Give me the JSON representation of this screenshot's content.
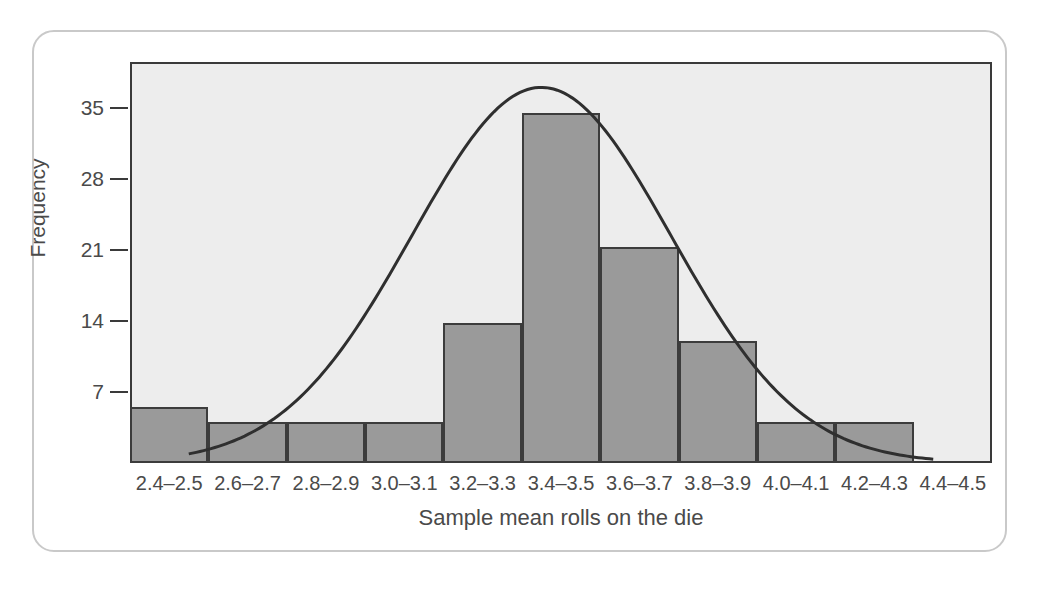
{
  "chart_data": {
    "type": "bar",
    "title": "",
    "xlabel": "Sample mean rolls on the die",
    "ylabel": "Frequency",
    "categories": [
      "2.4–2.5",
      "2.6–2.7",
      "2.8–2.9",
      "3.0–3.1",
      "3.2–3.3",
      "3.4–3.5",
      "3.6–3.7",
      "3.8–3.9",
      "4.0–4.1",
      "4.2–4.3",
      "4.4–4.5"
    ],
    "values": [
      5.5,
      4,
      4,
      4,
      13.8,
      34.5,
      21.3,
      12,
      4,
      4,
      0
    ],
    "ytick_labels": [
      "7",
      "14",
      "21",
      "28",
      "35"
    ],
    "ytick_values": [
      7,
      14,
      21,
      28,
      35
    ],
    "ylim": [
      0,
      39.5
    ],
    "grid": false,
    "legend": "none",
    "overlay": {
      "type": "line",
      "name": "normal-curve",
      "peak_x_category": "3.4–3.5",
      "peak_value": 37,
      "mean": 3.45,
      "sd": 0.33,
      "amplitude": 37
    },
    "colors": {
      "bar_fill": "#9a9a9a",
      "bar_stroke": "#3c3c3c",
      "curve": "#2f2f2f",
      "plot_background": "#ededed",
      "axis": "#3a3a3a",
      "text": "#4a4a4a",
      "card_border": "#c9c9c9",
      "page_background": "#ffffff"
    }
  },
  "figure": {
    "y_axis_title": "Frequency",
    "x_axis_title": "Sample mean rolls on the die"
  },
  "background_text": {
    "lines": [
      "reely software you are looking for. A common example is that",
      "time without knowing their source. When is this an issue? If we is",
      "as identifying the source software that is parsing the input data. In this case, you",
      "interest is a similar task. But what about the fact that a DOI or a URL?",
      "Depending on how the resource is cited. Consider the DOI as",
      "a reference link, but the key distinction is that citation and accessible",
      "identifier. Because of this, the best practice is use DOI in the"
    ]
  }
}
